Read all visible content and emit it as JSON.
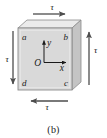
{
  "figure": {
    "caption": "(b)"
  },
  "block": {
    "front_face_color": "#d9d9d9",
    "top_face_color": "#ebebeb",
    "side_face_color": "#c4c4c4",
    "edge_color": "#8c8c8c",
    "corners": [
      {
        "id": "corner-a",
        "label": "a",
        "position": "top-left"
      },
      {
        "id": "corner-b",
        "label": "b",
        "position": "top-right"
      },
      {
        "id": "corner-c",
        "label": "c",
        "position": "bottom-right"
      },
      {
        "id": "corner-d",
        "label": "d",
        "position": "bottom-left"
      }
    ]
  },
  "axes": {
    "origin_label": "O",
    "y_label": "y",
    "x_label": "x",
    "axis_color": "#1a1a1a"
  },
  "stress_arrows": [
    {
      "id": "arrow-top",
      "label": "τ",
      "direction": "right",
      "face": "top"
    },
    {
      "id": "arrow-right",
      "label": "τ",
      "direction": "up",
      "face": "right"
    },
    {
      "id": "arrow-bottom",
      "label": "τ",
      "direction": "left",
      "face": "bottom"
    },
    {
      "id": "arrow-left",
      "label": "τ",
      "direction": "down",
      "face": "left"
    }
  ],
  "colors": {
    "arrow": "#4d4d4d",
    "text": "#1a1a1a",
    "background": "#ffffff"
  }
}
